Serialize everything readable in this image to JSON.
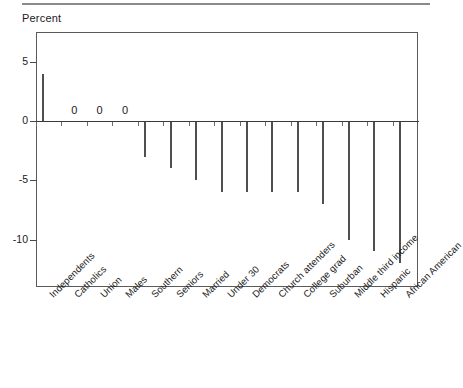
{
  "chart_data": {
    "type": "bar",
    "title": "",
    "subtitle": "",
    "xlabel": "",
    "ylabel": "Percent",
    "ylim": [
      -14,
      7.5
    ],
    "yticks": [
      5,
      0,
      -5,
      -10
    ],
    "ytick_labels": [
      "5",
      "0",
      "-5",
      "-10"
    ],
    "grid": false,
    "legend": null,
    "zero_line": 0,
    "bar_color": "#b4b4b4",
    "bar_edge_color": "#4f4f4f",
    "value_label_suffix": "",
    "categories": [
      "Independents",
      "Catholics",
      "Union",
      "Males",
      "Southern",
      "Seniors",
      "Married",
      "Under 30",
      "Democrats",
      "Church attenders",
      "College grad",
      "Suburban",
      "Middle third income",
      "Hispanic",
      "African American"
    ],
    "values": [
      4,
      0,
      0,
      0,
      -3,
      -4,
      -5,
      -6,
      -6,
      -6,
      -6,
      -7,
      -10,
      -11,
      -12
    ],
    "point_labels": [
      "",
      "0",
      "0",
      "0",
      "",
      "",
      "",
      "",
      "",
      "",
      "",
      "",
      "",
      "",
      ""
    ]
  },
  "figure": {
    "axis_title": "Percent",
    "top_rule": true
  }
}
